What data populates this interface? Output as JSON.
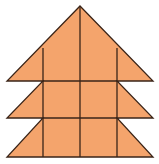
{
  "figure": {
    "colors": {
      "fill": "#F4A46C",
      "stroke": "#3A2418",
      "background": "#FFFFFF"
    },
    "outline_points": "80,6 153,81 117,81 153,118 117,118 153,157 7,157 43,118 7,118 43,81 7,81",
    "lines": [
      {
        "name": "center-vertical",
        "x1": 80,
        "y1": 6,
        "x2": 80,
        "y2": 157
      },
      {
        "name": "left-vertical",
        "x1": 43,
        "y1": 48,
        "x2": 43,
        "y2": 157
      },
      {
        "name": "right-vertical",
        "x1": 117,
        "y1": 48,
        "x2": 117,
        "y2": 157
      },
      {
        "name": "horizontal-upper",
        "x1": 43,
        "y1": 81,
        "x2": 117,
        "y2": 81
      },
      {
        "name": "horizontal-lower",
        "x1": 43,
        "y1": 118,
        "x2": 117,
        "y2": 118
      }
    ]
  }
}
